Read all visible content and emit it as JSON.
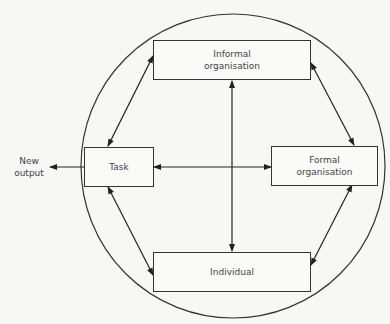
{
  "diagram": {
    "nodes": {
      "informal": "Informal organisation",
      "informal_l1": "Informal",
      "informal_l2": "organisation",
      "task": "Task",
      "formal_l1": "Formal",
      "formal_l2": "organisation",
      "individual": "Individual"
    },
    "output_label_l1": "New",
    "output_label_l2": "output",
    "edges": [
      {
        "from": "Task",
        "to": "New output",
        "type": "one-way"
      },
      {
        "from": "Task",
        "to": "Informal organisation",
        "type": "two-way"
      },
      {
        "from": "Task",
        "to": "Individual",
        "type": "two-way"
      },
      {
        "from": "Task",
        "to": "Formal organisation",
        "type": "two-way"
      },
      {
        "from": "Informal organisation",
        "to": "Individual",
        "type": "two-way"
      },
      {
        "from": "Informal organisation",
        "to": "Formal organisation",
        "type": "two-way"
      },
      {
        "from": "Individual",
        "to": "Formal organisation",
        "type": "two-way"
      }
    ]
  }
}
